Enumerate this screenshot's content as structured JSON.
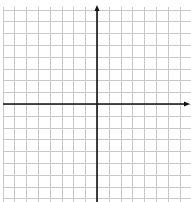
{
  "chart_data": {
    "type": "scatter",
    "title": "",
    "xlabel": "",
    "ylabel": "",
    "grid": true,
    "grid_spacing_units": 1,
    "xlim": [
      -8,
      8
    ],
    "ylim": [
      -8,
      8
    ],
    "x_ticks": [],
    "y_ticks": [],
    "tick_labels_visible": false,
    "axis_arrows": [
      "positive-x",
      "positive-y"
    ],
    "series": [],
    "legend": null
  },
  "style": {
    "grid_color": "#c8c8c8",
    "axis_color": "#111111",
    "background": "#ffffff"
  },
  "layout": {
    "origin_px": [
      97,
      104
    ],
    "cell_px": 11.8,
    "grid_left_px": 3,
    "grid_top_px": 7,
    "grid_right_px": 191,
    "grid_bottom_px": 202,
    "x_axis_end_px": 190,
    "y_axis_top_px": 5
  }
}
